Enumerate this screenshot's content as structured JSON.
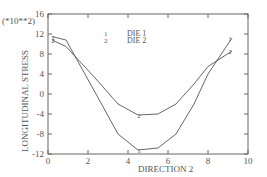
{
  "chart_data": {
    "type": "line",
    "title": "",
    "xlabel": "DIRECTION 2",
    "ylabel": "LONGITUDINAL STRESS",
    "y_multiplier_label": "(*10**2)",
    "xlim": [
      0,
      10
    ],
    "ylim": [
      -12,
      16
    ],
    "x_ticks": [
      0,
      2,
      4,
      6,
      8,
      10
    ],
    "y_ticks": [
      -12,
      -8,
      -4,
      0,
      4,
      8,
      12,
      16
    ],
    "grid": false,
    "legend": {
      "position": "top-center",
      "entries": [
        {
          "marker": "1",
          "label": "DIE 1"
        },
        {
          "marker": "2",
          "label": "DIE 2"
        }
      ]
    },
    "series": [
      {
        "name": "DIE 1",
        "marker": "1",
        "x": [
          0.2,
          0.9,
          2.4,
          3.5,
          4.5,
          5.5,
          6.4,
          7.3,
          8.0,
          9.2
        ],
        "y": [
          11.5,
          10.8,
          0.0,
          -8.0,
          -11.2,
          -10.8,
          -8.0,
          -2.0,
          4.0,
          11.2
        ]
      },
      {
        "name": "DIE 2",
        "marker": "2",
        "x": [
          0.2,
          0.9,
          2.4,
          3.5,
          4.5,
          5.5,
          6.4,
          7.3,
          8.0,
          9.2
        ],
        "y": [
          10.8,
          9.5,
          3.0,
          -2.0,
          -4.2,
          -4.0,
          -2.0,
          2.0,
          5.5,
          8.6
        ]
      }
    ]
  }
}
